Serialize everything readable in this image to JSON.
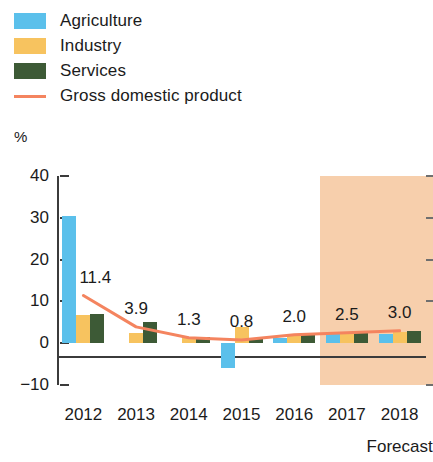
{
  "legend": {
    "items": [
      {
        "label": "Agriculture",
        "color": "#5bc0eb",
        "type": "swatch",
        "name": "legend-swatch-agriculture"
      },
      {
        "label": "Industry",
        "color": "#f7c35f",
        "type": "swatch",
        "name": "legend-swatch-industry"
      },
      {
        "label": "Services",
        "color": "#3d5a36",
        "type": "swatch",
        "name": "legend-swatch-services"
      },
      {
        "label": "Gross domestic product",
        "color": "#f4845f",
        "type": "line",
        "name": "legend-line-gdp"
      }
    ]
  },
  "axis": {
    "unit_label": "%",
    "y_ticks": [
      "40",
      "30",
      "20",
      "10",
      "0",
      "−10"
    ],
    "x_labels": [
      "2012",
      "2013",
      "2014",
      "2015",
      "2016",
      "2017",
      "2018"
    ],
    "forecast_caption": "Forecast"
  },
  "chart_data": {
    "type": "bar",
    "title": "",
    "subtitle": "",
    "xlabel": "",
    "ylabel": "%",
    "ylim": [
      -10,
      40
    ],
    "y_ticks": [
      40,
      30,
      20,
      10,
      0,
      -10
    ],
    "grid": false,
    "legend_position": "top-left",
    "categories": [
      "2012",
      "2013",
      "2014",
      "2015",
      "2016",
      "2017",
      "2018"
    ],
    "series": [
      {
        "name": "Agriculture",
        "color": "#5bc0eb",
        "values": [
          30.5,
          0.0,
          0.0,
          -6.0,
          1.3,
          2.2,
          2.2
        ]
      },
      {
        "name": "Industry",
        "color": "#f7c35f",
        "values": [
          6.8,
          2.5,
          1.6,
          3.9,
          1.8,
          2.6,
          2.6
        ]
      },
      {
        "name": "Services",
        "color": "#3d5a36",
        "values": [
          6.9,
          5.0,
          1.6,
          1.0,
          2.0,
          2.7,
          2.9
        ]
      }
    ],
    "line_series": {
      "name": "Gross domestic product",
      "color": "#f4845f",
      "values": [
        11.4,
        3.9,
        1.3,
        0.8,
        2.0,
        2.5,
        3.0
      ],
      "labels": [
        "11.4",
        "3.9",
        "1.3",
        "0.8",
        "2.0",
        "2.5",
        "3.0"
      ]
    },
    "annotations": [
      {
        "text": "Forecast",
        "from_category": "2017",
        "to_category": "2018",
        "shading_color": "#f7cfac"
      }
    ]
  }
}
